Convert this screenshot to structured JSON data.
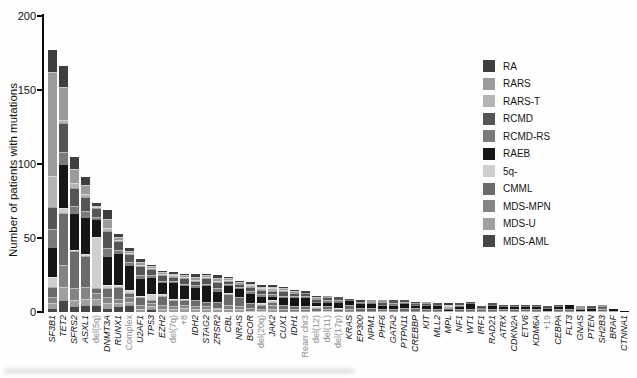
{
  "chart_data": {
    "type": "bar",
    "stacked": true,
    "title": "",
    "xlabel": "",
    "ylabel": "Number of patients with mutations",
    "ylim": [
      0,
      200
    ],
    "yticks": [
      0,
      50,
      100,
      150,
      200
    ],
    "grid": false,
    "legend_position": "right",
    "segment_categories": [
      "RA",
      "RARS",
      "RARS-T",
      "RCMD",
      "RCMD-RS",
      "RAEB",
      "5q-",
      "CMML",
      "MDS-MPN",
      "MDS-U",
      "MDS-AML"
    ],
    "segment_colors": [
      "#3f3f3f",
      "#9b9b9b",
      "#b4b4b4",
      "#555555",
      "#7a7a7a",
      "#161616",
      "#cfcfcf",
      "#6b6b6b",
      "#848484",
      "#a0a0a0",
      "#474747"
    ],
    "stack_order_note": "segments stacked with RA at top of each bar through MDS-AML at bottom, matching legend order",
    "bars": [
      {
        "label": "SF3B1",
        "kind": "gene",
        "total": 177,
        "values": [
          15,
          70,
          21,
          15,
          12,
          20,
          7,
          7,
          4,
          3,
          3
        ]
      },
      {
        "label": "TET2",
        "kind": "gene",
        "total": 166,
        "values": [
          14,
          22,
          2,
          20,
          8,
          30,
          3,
          35,
          15,
          9,
          8
        ]
      },
      {
        "label": "SFRS2",
        "kind": "gene",
        "total": 105,
        "values": [
          8,
          10,
          3,
          12,
          5,
          25,
          1,
          25,
          8,
          4,
          4
        ]
      },
      {
        "label": "ASXL1",
        "kind": "gene",
        "total": 91,
        "values": [
          5,
          6,
          2,
          10,
          4,
          25,
          1,
          21,
          8,
          4,
          5
        ]
      },
      {
        "label": "del(5q)",
        "kind": "cytogenetic",
        "total": 74,
        "values": [
          2,
          1,
          1,
          6,
          1,
          12,
          35,
          3,
          4,
          4,
          5
        ]
      },
      {
        "label": "DNMT3A",
        "kind": "gene",
        "total": 69,
        "values": [
          6,
          6,
          2,
          12,
          5,
          20,
          2,
          6,
          4,
          3,
          3
        ]
      },
      {
        "label": "RUNX1",
        "kind": "gene",
        "total": 53,
        "values": [
          2,
          2,
          1,
          6,
          2,
          22,
          1,
          8,
          3,
          2,
          4
        ]
      },
      {
        "label": "Complex",
        "kind": "cytogenetic",
        "total": 43,
        "values": [
          2,
          1,
          1,
          5,
          2,
          17,
          2,
          3,
          3,
          2,
          5
        ]
      },
      {
        "label": "U2AF1",
        "kind": "gene",
        "total": 36,
        "values": [
          2,
          2,
          1,
          6,
          2,
          12,
          1,
          5,
          3,
          1,
          1
        ]
      },
      {
        "label": "TP53",
        "kind": "gene",
        "total": 32,
        "values": [
          1,
          1,
          1,
          4,
          1,
          12,
          4,
          2,
          2,
          2,
          2
        ]
      },
      {
        "label": "EZH2",
        "kind": "gene",
        "total": 28,
        "values": [
          1,
          1,
          1,
          4,
          1,
          8,
          1,
          6,
          3,
          1,
          1
        ]
      },
      {
        "label": "del(7q)",
        "kind": "cytogenetic",
        "total": 27,
        "values": [
          1,
          1,
          1,
          3,
          1,
          11,
          1,
          4,
          2,
          1,
          1
        ]
      },
      {
        "label": "+8",
        "kind": "cytogenetic",
        "total": 26,
        "values": [
          1,
          1,
          1,
          4,
          1,
          9,
          1,
          3,
          2,
          2,
          1
        ]
      },
      {
        "label": "IDH2",
        "kind": "gene",
        "total": 26,
        "values": [
          2,
          2,
          1,
          3,
          1,
          9,
          0,
          4,
          2,
          1,
          1
        ]
      },
      {
        "label": "STAG2",
        "kind": "gene",
        "total": 26,
        "values": [
          1,
          1,
          1,
          4,
          1,
          11,
          0,
          3,
          2,
          1,
          1
        ]
      },
      {
        "label": "ZRSR2",
        "kind": "gene",
        "total": 25,
        "values": [
          2,
          2,
          1,
          4,
          2,
          7,
          0,
          4,
          1,
          1,
          1
        ]
      },
      {
        "label": "CBL",
        "kind": "gene",
        "total": 24,
        "values": [
          1,
          1,
          1,
          2,
          1,
          5,
          1,
          7,
          3,
          1,
          1
        ]
      },
      {
        "label": "NRAS",
        "kind": "gene",
        "total": 21,
        "values": [
          1,
          1,
          0,
          2,
          1,
          6,
          0,
          6,
          2,
          1,
          1
        ]
      },
      {
        "label": "BCOR",
        "kind": "gene",
        "total": 20,
        "values": [
          1,
          1,
          1,
          3,
          1,
          7,
          0,
          3,
          2,
          1,
          0
        ]
      },
      {
        "label": "del(20q)",
        "kind": "cytogenetic",
        "total": 18,
        "values": [
          1,
          1,
          1,
          3,
          1,
          5,
          1,
          3,
          1,
          1,
          0
        ]
      },
      {
        "label": "JAK2",
        "kind": "gene",
        "total": 18,
        "values": [
          1,
          1,
          2,
          2,
          1,
          3,
          1,
          2,
          3,
          1,
          1
        ]
      },
      {
        "label": "CUX1",
        "kind": "gene",
        "total": 17,
        "values": [
          1,
          1,
          1,
          3,
          1,
          5,
          0,
          3,
          2,
          0,
          0
        ]
      },
      {
        "label": "IDH1",
        "kind": "gene",
        "total": 15,
        "values": [
          1,
          1,
          0,
          2,
          1,
          6,
          0,
          2,
          1,
          0,
          1
        ]
      },
      {
        "label": "Rearr chr3",
        "kind": "cytogenetic",
        "total": 14,
        "values": [
          1,
          0,
          0,
          2,
          1,
          6,
          0,
          2,
          1,
          0,
          1
        ]
      },
      {
        "label": "del(12)",
        "kind": "cytogenetic",
        "total": 11,
        "values": [
          1,
          1,
          0,
          2,
          0,
          3,
          1,
          2,
          1,
          0,
          0
        ]
      },
      {
        "label": "del(11)",
        "kind": "cytogenetic",
        "total": 11,
        "values": [
          0,
          1,
          0,
          2,
          1,
          3,
          0,
          2,
          1,
          1,
          0
        ]
      },
      {
        "label": "del(17p)",
        "kind": "cytogenetic",
        "total": 10,
        "values": [
          0,
          0,
          0,
          2,
          1,
          4,
          1,
          1,
          0,
          0,
          1
        ]
      },
      {
        "label": "KRAS",
        "kind": "gene",
        "total": 9,
        "values": [
          0,
          0,
          0,
          1,
          0,
          3,
          0,
          3,
          1,
          0,
          1
        ]
      },
      {
        "label": "EP300",
        "kind": "gene",
        "total": 8,
        "values": [
          1,
          0,
          0,
          1,
          0,
          3,
          0,
          2,
          0,
          0,
          1
        ]
      },
      {
        "label": "NPM1",
        "kind": "gene",
        "total": 8,
        "values": [
          0,
          1,
          0,
          1,
          0,
          3,
          0,
          2,
          0,
          0,
          1
        ]
      },
      {
        "label": "PHF6",
        "kind": "gene",
        "total": 8,
        "values": [
          0,
          1,
          0,
          2,
          0,
          3,
          0,
          1,
          1,
          0,
          0
        ]
      },
      {
        "label": "GATA2",
        "kind": "gene",
        "total": 8,
        "values": [
          0,
          0,
          0,
          2,
          1,
          3,
          0,
          1,
          0,
          0,
          1
        ]
      },
      {
        "label": "PTPN11",
        "kind": "gene",
        "total": 8,
        "values": [
          0,
          0,
          0,
          1,
          1,
          3,
          0,
          2,
          0,
          0,
          1
        ]
      },
      {
        "label": "CREBBP",
        "kind": "gene",
        "total": 7,
        "values": [
          1,
          0,
          0,
          1,
          0,
          2,
          0,
          2,
          0,
          0,
          1
        ]
      },
      {
        "label": "KIT",
        "kind": "gene",
        "total": 7,
        "values": [
          0,
          1,
          0,
          1,
          0,
          3,
          0,
          1,
          0,
          0,
          1
        ]
      },
      {
        "label": "MLL2",
        "kind": "gene",
        "total": 6,
        "values": [
          0,
          0,
          0,
          1,
          0,
          3,
          0,
          1,
          0,
          0,
          1
        ]
      },
      {
        "label": "MPL",
        "kind": "gene",
        "total": 6,
        "values": [
          1,
          1,
          1,
          1,
          0,
          1,
          0,
          0,
          1,
          0,
          0
        ]
      },
      {
        "label": "NF1",
        "kind": "gene",
        "total": 6,
        "values": [
          0,
          0,
          0,
          1,
          1,
          2,
          0,
          1,
          0,
          0,
          1
        ]
      },
      {
        "label": "WT1",
        "kind": "gene",
        "total": 7,
        "values": [
          0,
          0,
          0,
          1,
          0,
          4,
          0,
          1,
          0,
          0,
          1
        ]
      },
      {
        "label": "IRF1",
        "kind": "gene",
        "total": 4,
        "values": [
          0,
          0,
          0,
          1,
          0,
          1,
          0,
          1,
          0,
          0,
          1
        ]
      },
      {
        "label": "RAD21",
        "kind": "gene",
        "total": 6,
        "values": [
          0,
          0,
          0,
          1,
          0,
          3,
          0,
          1,
          0,
          0,
          1
        ]
      },
      {
        "label": "ATRX",
        "kind": "gene",
        "total": 5,
        "values": [
          0,
          0,
          0,
          1,
          0,
          2,
          0,
          1,
          0,
          1,
          0
        ]
      },
      {
        "label": "CDKN2A",
        "kind": "gene",
        "total": 5,
        "values": [
          0,
          0,
          0,
          1,
          0,
          2,
          0,
          1,
          0,
          0,
          1
        ]
      },
      {
        "label": "ETV6",
        "kind": "gene",
        "total": 5,
        "values": [
          0,
          0,
          0,
          1,
          0,
          2,
          0,
          1,
          1,
          0,
          0
        ]
      },
      {
        "label": "KDM6A",
        "kind": "gene",
        "total": 5,
        "values": [
          0,
          0,
          0,
          1,
          0,
          2,
          0,
          1,
          0,
          0,
          1
        ]
      },
      {
        "label": "+19",
        "kind": "cytogenetic",
        "total": 4,
        "values": [
          0,
          0,
          0,
          1,
          0,
          2,
          0,
          1,
          0,
          0,
          0
        ]
      },
      {
        "label": "CEBPA",
        "kind": "gene",
        "total": 5,
        "values": [
          0,
          0,
          0,
          1,
          0,
          2,
          0,
          1,
          0,
          0,
          1
        ]
      },
      {
        "label": "FLT3",
        "kind": "gene",
        "total": 5,
        "values": [
          0,
          0,
          0,
          0,
          0,
          3,
          0,
          1,
          0,
          0,
          1
        ]
      },
      {
        "label": "GNAS",
        "kind": "gene",
        "total": 4,
        "values": [
          0,
          1,
          0,
          1,
          0,
          1,
          0,
          1,
          0,
          0,
          0
        ]
      },
      {
        "label": "PTEN",
        "kind": "gene",
        "total": 4,
        "values": [
          0,
          0,
          0,
          1,
          0,
          2,
          0,
          1,
          0,
          0,
          0
        ]
      },
      {
        "label": "SH2B3",
        "kind": "gene",
        "total": 5,
        "values": [
          0,
          1,
          0,
          1,
          0,
          1,
          0,
          1,
          1,
          0,
          0
        ]
      },
      {
        "label": "BRAF",
        "kind": "gene",
        "total": 2,
        "values": [
          0,
          0,
          0,
          0,
          0,
          1,
          0,
          1,
          0,
          0,
          0
        ]
      },
      {
        "label": "CTNNA1",
        "kind": "gene",
        "total": 1,
        "values": [
          0,
          0,
          0,
          0,
          0,
          1,
          0,
          0,
          0,
          0,
          0
        ]
      }
    ],
    "legend_entries": [
      "RA",
      "RARS",
      "RARS-T",
      "RCMD",
      "RCMD-RS",
      "RAEB",
      "5q-",
      "CMML",
      "MDS-MPN",
      "MDS-U",
      "MDS-AML"
    ]
  }
}
